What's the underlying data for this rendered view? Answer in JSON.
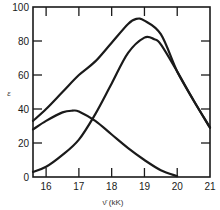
{
  "chart_data": {
    "type": "line",
    "title": "",
    "xlabel": "ν̄ (kK)",
    "ylabel": "ε",
    "xlim": [
      15.6,
      21
    ],
    "ylim": [
      0,
      100
    ],
    "x_ticks": [
      16,
      17,
      18,
      19,
      20,
      21
    ],
    "y_ticks": [
      0,
      20,
      40,
      60,
      80,
      100
    ],
    "grid": false,
    "legend": null,
    "series": [
      {
        "name": "curve-upper",
        "x": [
          15.6,
          16,
          16.5,
          17,
          17.5,
          18,
          18.5,
          18.75,
          19,
          19.5,
          20,
          20.5,
          21
        ],
        "y": [
          33,
          40,
          50,
          60,
          68,
          79,
          90,
          93,
          92,
          84,
          62,
          45,
          29
        ]
      },
      {
        "name": "curve-bell",
        "x": [
          15.6,
          16,
          16.5,
          16.8,
          17,
          17.5,
          18,
          18.5,
          19,
          19.5,
          20
        ],
        "y": [
          28,
          33,
          38,
          39,
          38.5,
          33,
          25,
          17,
          10,
          4,
          0.5
        ]
      },
      {
        "name": "curve-lower",
        "x": [
          15.6,
          16,
          16.5,
          17,
          17.5,
          18,
          18.5,
          19,
          19.3,
          19.5,
          20,
          20.5,
          21
        ],
        "y": [
          3,
          6,
          13,
          22,
          37,
          55,
          73,
          82,
          81,
          78,
          62,
          45,
          29
        ]
      }
    ]
  },
  "labels": {
    "x_axis": "ν̄ (kK)",
    "y_axis": "ε"
  },
  "colors": {
    "line": "#1a1a1a",
    "axis": "#1a1a1a",
    "background": "#ffffff"
  }
}
